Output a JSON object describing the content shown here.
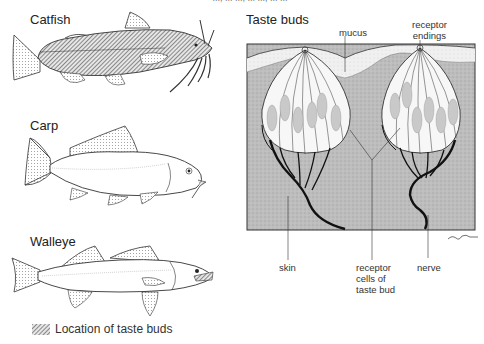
{
  "caption_cut": "..., ... ..., ... ..., ... ...",
  "fish": [
    {
      "name": "Catfish"
    },
    {
      "name": "Carp"
    },
    {
      "name": "Walleye"
    }
  ],
  "legend": {
    "label": "Location of taste buds",
    "swatch": "hatched-gray"
  },
  "taste_buds_panel": {
    "title": "Taste buds",
    "labels": {
      "mucus": "mucus",
      "receptor_endings_1": "receptor",
      "receptor_endings_2": "endings",
      "skin": "skin",
      "receptor_cells_1": "receptor",
      "receptor_cells_2": "cells of",
      "receptor_cells_3": "taste bud",
      "nerve": "nerve"
    },
    "signature": "C.Pale"
  },
  "colors": {
    "skin_fill": "#b8b8b8",
    "mucus_fill": "#ececec",
    "bud_fill": "#f7f7f7",
    "cell_fill": "#c8c8c8",
    "nerve": "#111111",
    "outline": "#333333"
  }
}
